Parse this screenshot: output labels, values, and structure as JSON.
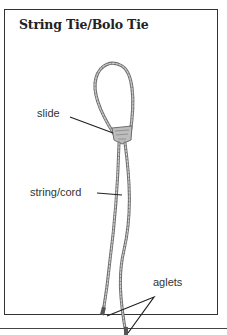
{
  "title": "String Tie/Bolo Tie",
  "labels": {
    "slide": "slide",
    "string_cord": "string/cord",
    "aglets": "aglets"
  },
  "colors": {
    "frame": "#333333",
    "cord": "#9a9a9a",
    "cord_dark": "#6e6e6e",
    "leader": "#222222",
    "background": "#ffffff"
  }
}
